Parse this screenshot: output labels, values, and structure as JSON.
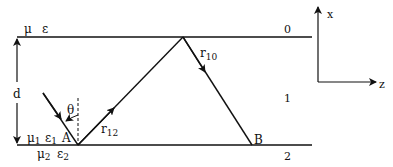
{
  "diagram": {
    "top_labels": {
      "mu": "μ",
      "eps": "ε"
    },
    "layer_labels": {
      "top": "0",
      "middle": "1",
      "bottom": "2"
    },
    "thickness_label": "d",
    "angle_label": "θ",
    "point_a": "A",
    "point_b": "B",
    "ray_r12": {
      "base": "r",
      "sub": "12"
    },
    "ray_r10": {
      "base": "r",
      "sub": "10"
    },
    "medium1": {
      "mu": "μ",
      "mu_sub": "1",
      "eps": "ε",
      "eps_sub": "1"
    },
    "medium2": {
      "mu": "μ",
      "mu_sub": "2",
      "eps": "ε",
      "eps_sub": "2"
    },
    "axes": {
      "vertical": "x",
      "horizontal": "z"
    },
    "colors": {
      "line": "#111111",
      "background": "#ffffff"
    }
  }
}
